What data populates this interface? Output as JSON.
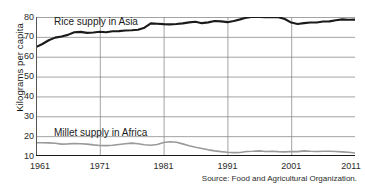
{
  "axis": {
    "ylabel": "Kilograms per capita",
    "yticks": [
      10,
      20,
      30,
      40,
      50,
      60,
      70,
      80
    ],
    "xticks": [
      1961,
      1971,
      1981,
      1991,
      2001,
      2011
    ]
  },
  "labels": {
    "rice": "Rice supply in Asia",
    "millet": "Millet supply in Africa"
  },
  "source": "Source: Food and Agricultural Organization.",
  "colors": {
    "rice": "#1a1a1a",
    "millet": "#9a9a9a",
    "grid": "#8c8c8c",
    "axis": "#555555",
    "background": "#ffffff"
  },
  "chart_data": {
    "type": "line",
    "title": "",
    "subtitle": "",
    "xlabel": "",
    "ylabel": "Kilograms per capita",
    "xlim": [
      1961,
      2011
    ],
    "ylim": [
      10,
      80
    ],
    "xticks": [
      1961,
      1971,
      1981,
      1991,
      2001,
      2011
    ],
    "yticks": [
      10,
      20,
      30,
      40,
      50,
      60,
      70,
      80
    ],
    "grid": "horizontal-and-vertical",
    "legend": "inline-labels",
    "annotations": [
      {
        "text": "Rice supply in Asia",
        "x": 1965,
        "y": 83
      },
      {
        "text": "Millet supply in Africa",
        "x": 1965,
        "y": 21
      }
    ],
    "x": [
      1961,
      1962,
      1963,
      1964,
      1965,
      1966,
      1967,
      1968,
      1969,
      1970,
      1971,
      1972,
      1973,
      1974,
      1975,
      1976,
      1977,
      1978,
      1979,
      1980,
      1981,
      1982,
      1983,
      1984,
      1985,
      1986,
      1987,
      1988,
      1989,
      1990,
      1991,
      1992,
      1993,
      1994,
      1995,
      1996,
      1997,
      1998,
      1999,
      2000,
      2001,
      2002,
      2003,
      2004,
      2005,
      2006,
      2007,
      2008,
      2009,
      2010,
      2011
    ],
    "series": [
      {
        "name": "Rice supply in Asia",
        "color": "#1a1a1a",
        "values": [
          64.8,
          66.4,
          68.3,
          69.6,
          70.2,
          71.0,
          72.3,
          72.5,
          72.0,
          72.2,
          72.6,
          72.3,
          72.8,
          72.9,
          73.2,
          73.3,
          73.6,
          74.6,
          76.8,
          76.6,
          76.4,
          76.3,
          76.5,
          76.8,
          77.3,
          77.6,
          76.9,
          77.3,
          78.0,
          77.8,
          77.4,
          78.0,
          78.8,
          79.7,
          80.1,
          80.0,
          79.9,
          80.0,
          79.9,
          79.0,
          77.2,
          76.5,
          76.9,
          77.2,
          77.2,
          77.7,
          77.8,
          78.4,
          78.8,
          78.6,
          78.7
        ]
      },
      {
        "name": "Millet supply in Africa",
        "color": "#9a9a9a",
        "values": [
          16.7,
          16.7,
          16.6,
          16.4,
          16.0,
          16.1,
          16.3,
          16.2,
          16.0,
          15.6,
          15.3,
          15.2,
          15.4,
          15.8,
          16.2,
          16.5,
          16.2,
          15.7,
          15.4,
          15.8,
          16.8,
          17.2,
          16.9,
          16.1,
          15.2,
          14.4,
          13.8,
          13.1,
          12.6,
          12.2,
          11.9,
          11.7,
          11.8,
          12.3,
          12.4,
          12.6,
          12.3,
          12.4,
          12.2,
          12.1,
          12.3,
          12.2,
          12.6,
          12.4,
          12.3,
          12.4,
          12.4,
          12.3,
          12.1,
          11.9,
          11.5
        ]
      }
    ]
  }
}
